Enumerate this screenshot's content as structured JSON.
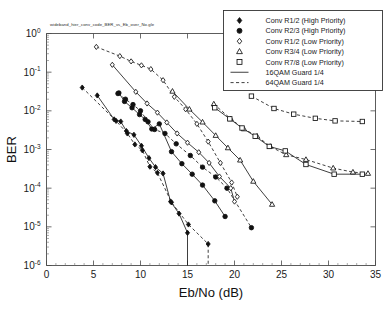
{
  "figure": {
    "caption": "wideband_hier_conv_code_BER_vs_Eb_over_No.gle"
  },
  "axes": {
    "x_title": "Eb/No (dB)",
    "y_title": "BER",
    "x_ticks": [
      "0",
      "5",
      "10",
      "15",
      "20",
      "25",
      "30",
      "35"
    ],
    "y_ticks": [
      "10^0",
      "10^-1",
      "10^-2",
      "10^-3",
      "10^-4",
      "10^-5",
      "10^-6"
    ],
    "y_tick_exponents": [
      "0",
      "-1",
      "-2",
      "-3",
      "-4",
      "-5",
      "-6"
    ],
    "y_tick_base": "10"
  },
  "legend": {
    "items": [
      {
        "label": "Conv R1/2 (High Priority)",
        "marker": "filled-diamond-icon"
      },
      {
        "label": "Conv R2/3 (High Priority)",
        "marker": "filled-circle-icon"
      },
      {
        "label": "Conv R1/2 (Low Priority)",
        "marker": "open-diamond-icon"
      },
      {
        "label": "Conv R3/4 (Low Priority)",
        "marker": "open-triangle-icon"
      },
      {
        "label": "Conv R7/8 (Low Priority)",
        "marker": "open-square-icon"
      },
      {
        "label": "16QAM Guard 1/4",
        "marker": "solid-line-icon"
      },
      {
        "label": "64QAM Guard 1/4",
        "marker": "dashed-line-icon"
      }
    ]
  },
  "chart_data": {
    "type": "line",
    "title": "wideband_hier_conv_code_BER_vs_Eb_over_No.gle",
    "xlabel": "Eb/No (dB)",
    "ylabel": "BER",
    "xlim": [
      0,
      35
    ],
    "ylim": [
      1e-06,
      1
    ],
    "yscale": "log",
    "grid": false,
    "legend_position": "top-right",
    "series": [
      {
        "name": "Conv R1/2 (High Priority) 16QAM Guard 1/4",
        "marker": "filled-diamond",
        "line": "solid",
        "x": [
          5.4,
          7.2,
          7.9,
          8.5,
          9.3,
          10.1,
          10.9,
          11.6,
          12.4,
          13.2,
          14.1,
          15.0,
          15.0
        ],
        "y": [
          0.025,
          0.006,
          0.0053,
          0.003,
          0.0024,
          0.00125,
          0.0006,
          0.00035,
          0.00024,
          4.5e-05,
          2.2e-05,
          7e-06,
          1e-06
        ]
      },
      {
        "name": "Conv R1/2 (High Priority) 64QAM Guard 1/4",
        "marker": "filled-diamond",
        "line": "dashed",
        "x": [
          3.8,
          7.4,
          8.6,
          9.4,
          10.2,
          11.0,
          11.8,
          13.3,
          15.1,
          17.2,
          17.2
        ],
        "y": [
          0.04,
          0.0055,
          0.0026,
          0.00135,
          0.00095,
          0.00036,
          0.00025,
          4.3e-05,
          1.15e-05,
          3.6e-06,
          1e-06
        ]
      },
      {
        "name": "Conv R2/3 (High Priority) 16QAM Guard 1/4",
        "marker": "filled-circle",
        "line": "solid",
        "x": [
          7.7,
          8.3,
          9.1,
          9.9,
          10.5,
          11.2,
          12.0,
          13.3,
          14.4,
          15.5,
          16.6,
          17.9,
          19.0
        ],
        "y": [
          0.029,
          0.0175,
          0.012,
          0.008,
          0.006,
          0.0034,
          0.0046,
          0.00088,
          0.00043,
          0.00023,
          0.00012,
          4.7e-05,
          1.85e-05
        ]
      },
      {
        "name": "Conv R2/3 (High Priority) 64QAM Guard 1/4",
        "marker": "filled-circle",
        "line": "dashed",
        "x": [
          7.6,
          8.4,
          9.2,
          10.0,
          10.8,
          11.5,
          12.6,
          13.8,
          15.3,
          16.6,
          18.0,
          19.2,
          21.8
        ],
        "y": [
          0.028,
          0.02,
          0.0145,
          0.01,
          0.0052,
          0.0033,
          0.0026,
          0.0014,
          0.0007,
          0.00035,
          0.000195,
          0.0001,
          9.5e-06
        ]
      },
      {
        "name": "Conv R1/2 (Low Priority) 16QAM Guard 1/4",
        "marker": "open-diamond",
        "line": "solid",
        "x": [
          7.0,
          9.5,
          10.7,
          11.8,
          12.8,
          13.9,
          15.0,
          16.2,
          17.3,
          18.4,
          19.6,
          20.0
        ],
        "y": [
          0.155,
          0.031,
          0.0155,
          0.009,
          0.005,
          0.0026,
          0.0015,
          0.00085,
          0.00045,
          0.0002,
          0.0001,
          4.5e-05
        ]
      },
      {
        "name": "Conv R1/2 (Low Priority) 64QAM Guard 1/4",
        "marker": "open-diamond",
        "line": "dashed",
        "x": [
          5.3,
          7.8,
          9.0,
          10.1,
          11.1,
          12.4,
          13.6,
          14.8,
          16.0,
          17.2,
          18.5,
          19.7,
          20.3
        ],
        "y": [
          0.45,
          0.26,
          0.19,
          0.15,
          0.12,
          0.062,
          0.023,
          0.011,
          0.0046,
          0.0016,
          0.00045,
          0.00014,
          6e-05
        ]
      },
      {
        "name": "Conv R3/4 (Low Priority) 16QAM Guard 1/4",
        "marker": "open-triangle",
        "line": "solid",
        "x": [
          13.4,
          15.2,
          16.6,
          18.0,
          19.3,
          20.6,
          22.0,
          24.0
        ],
        "y": [
          0.032,
          0.011,
          0.0051,
          0.0023,
          0.0011,
          0.00053,
          0.00015,
          3.8e-05
        ]
      },
      {
        "name": "Conv R3/4 (Low Priority) 64QAM Guard 1/4",
        "marker": "open-triangle",
        "line": "dashed",
        "x": [
          17.8,
          19.6,
          21.0,
          22.4,
          23.8,
          25.5,
          27.6,
          30.5,
          32.6,
          34.2
        ],
        "y": [
          0.015,
          0.0062,
          0.0034,
          0.0022,
          0.0012,
          0.00073,
          0.00055,
          0.00033,
          0.00026,
          0.00024
        ]
      },
      {
        "name": "Conv R7/8 (Low Priority) 16QAM Guard 1/4",
        "marker": "open-square",
        "line": "solid",
        "x": [
          17.9,
          19.5,
          20.8,
          22.2,
          23.7,
          25.4,
          27.6,
          30.6,
          33.6
        ],
        "y": [
          0.012,
          0.0062,
          0.0036,
          0.0022,
          0.0012,
          0.00092,
          0.00041,
          0.00023,
          0.00023
        ]
      },
      {
        "name": "Conv R7/8 (Low Priority) 64QAM Guard 1/4",
        "marker": "open-square",
        "line": "dashed",
        "x": [
          21.8,
          24.2,
          26.3,
          28.6,
          30.7,
          33.6
        ],
        "y": [
          0.024,
          0.0115,
          0.0082,
          0.0064,
          0.0055,
          0.0053
        ]
      }
    ]
  }
}
